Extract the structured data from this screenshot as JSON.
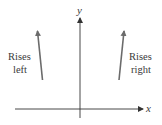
{
  "axes": {
    "x_label": "x",
    "y_label": "y",
    "color": "#333333"
  },
  "annotations": {
    "left": {
      "line1": "Rises",
      "line2": "left"
    },
    "right": {
      "line1": "Rises",
      "line2": "right"
    }
  },
  "arrows": {
    "color": "#6b6b6b"
  }
}
